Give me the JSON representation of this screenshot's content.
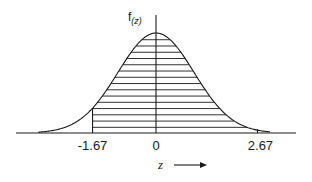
{
  "figure": {
    "y_axis_label": "f(z)",
    "y_axis_label_main": "f",
    "y_axis_label_sub": "(z)",
    "x_axis_label": "z",
    "x_axis_arrow": "→",
    "ticks": [
      {
        "value": -1.67,
        "label": "-1.67"
      },
      {
        "value": 0,
        "label": "0"
      },
      {
        "value": 2.67,
        "label": "2.67"
      }
    ],
    "shaded_region": {
      "from": -1.67,
      "to": 2.67,
      "style": "horizontal hatching",
      "hatch_line_count": 15
    },
    "colors": {
      "ink": "#1a1a1a",
      "background": "#ffffff"
    }
  },
  "chart_data": {
    "type": "area",
    "title": "",
    "xlabel": "z",
    "ylabel": "f(z)",
    "distribution": "standard normal",
    "mean": 0,
    "std": 1,
    "x_ticks": [
      -1.67,
      0,
      2.67
    ],
    "x_tick_labels": [
      "-1.67",
      "0",
      "2.67"
    ],
    "shaded_interval": [
      -1.67,
      2.67
    ],
    "xlim": [
      -3.5,
      3.7
    ],
    "grid": false,
    "legend": null
  }
}
